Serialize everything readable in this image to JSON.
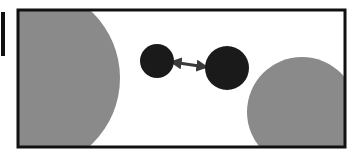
{
  "diagram": {
    "colors": {
      "background": "#ffffff",
      "frame": "#111111",
      "large_circle": "#8a8a8a",
      "small_circle": "#1a1a1a",
      "arrow": "#3a3a3a"
    },
    "elements": {
      "frame": {
        "x": 18,
        "y": 10,
        "width": 327,
        "height": 137
      },
      "left_edge_mark": {
        "x": 1,
        "y": 12,
        "width": 4,
        "height": 44
      },
      "large_circle_left": {
        "cx": 28,
        "cy": 78,
        "r": 92
      },
      "large_circle_right": {
        "cx": 302,
        "cy": 112,
        "r": 55
      },
      "small_circle_left": {
        "cx": 157,
        "cy": 61,
        "r": 17
      },
      "small_circle_right": {
        "cx": 227,
        "cy": 68,
        "r": 22
      },
      "arrow": {
        "x1": 172,
        "y1": 62,
        "x2": 206,
        "y2": 67
      }
    }
  }
}
